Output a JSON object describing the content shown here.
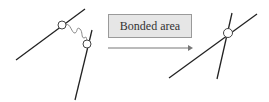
{
  "diagram": {
    "label": "Bonded area",
    "colors": {
      "line": "#222222",
      "box_fill": "#e6e6e6",
      "box_border": "#9a9a9a",
      "arrow": "#777777"
    },
    "left_state": {
      "description": "Two separate fibers connected by a wavy bridge with circular nodes"
    },
    "right_state": {
      "description": "Two crossing fibers bonded at a single circular node"
    }
  }
}
